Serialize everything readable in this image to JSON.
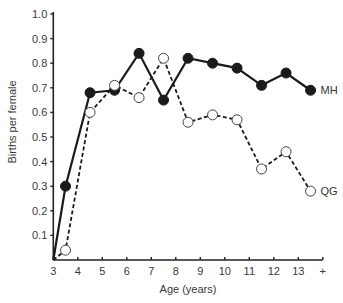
{
  "chart_data": {
    "type": "line",
    "title": "",
    "xlabel": "Age (years)",
    "ylabel": "Births per female",
    "xlim": [
      3,
      14
    ],
    "ylim": [
      0,
      1.0
    ],
    "x_ticks": [
      3,
      4,
      5,
      6,
      7,
      8,
      9,
      10,
      11,
      12,
      13,
      14
    ],
    "x_tick_labels": [
      "3",
      "4",
      "5",
      "6",
      "7",
      "8",
      "9",
      "10",
      "11",
      "12",
      "13",
      "+"
    ],
    "y_ticks": [
      0.1,
      0.2,
      0.3,
      0.4,
      0.5,
      0.6,
      0.7,
      0.8,
      0.9,
      1.0
    ],
    "y_tick_labels": [
      "0.1",
      "0.2",
      "0.3",
      "0.4",
      "0.5",
      "0.6",
      "0.7",
      "0.8",
      "0.9",
      "1.0"
    ],
    "grid": false,
    "legend": "direct labels at line ends (right)",
    "x": [
      3,
      3.5,
      4.5,
      5.5,
      6.5,
      7.5,
      8.5,
      9.5,
      10.5,
      11.5,
      12.5,
      13.5
    ],
    "series": [
      {
        "name": "MH",
        "line_style": "solid",
        "marker": "filled-circle",
        "color": "#1a1a1a",
        "values": [
          0,
          0.3,
          0.68,
          0.69,
          0.84,
          0.65,
          0.82,
          0.8,
          0.78,
          0.71,
          0.76,
          0.69
        ],
        "marker_mask": [
          false,
          true,
          true,
          true,
          true,
          true,
          true,
          true,
          true,
          true,
          true,
          true
        ]
      },
      {
        "name": "QG",
        "line_style": "dashed",
        "marker": "open-circle",
        "color": "#1a1a1a",
        "values": [
          0,
          0.04,
          0.6,
          0.71,
          0.66,
          0.82,
          0.56,
          0.59,
          0.57,
          0.37,
          0.44,
          0.28
        ],
        "marker_mask": [
          false,
          true,
          true,
          true,
          true,
          true,
          true,
          true,
          true,
          true,
          true,
          true
        ]
      }
    ]
  }
}
